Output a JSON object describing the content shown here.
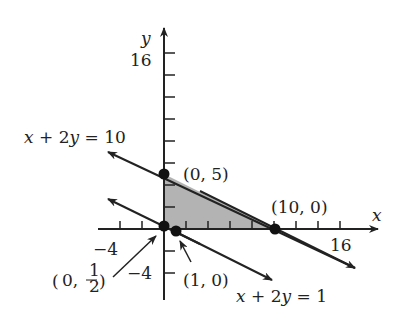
{
  "diagram": {
    "type": "linear-inequality-graph",
    "axes": {
      "x_label": "x",
      "y_label": "y",
      "x_tick_labels": [
        "−4",
        "16"
      ],
      "y_tick_labels": [
        "16",
        "−4"
      ],
      "tick_step": 2
    },
    "lines": [
      {
        "equation": "x + 2y = 10",
        "label_lhs": "x",
        "label_mid": " + 2",
        "label_var": "y",
        "label_rhs": " = 10"
      },
      {
        "equation": "x + 2y = 1",
        "label_lhs": "x",
        "label_mid": " + 2",
        "label_var": "y",
        "label_rhs": " = 1"
      }
    ],
    "points": [
      {
        "label": "(0, 5)",
        "x": 0,
        "y": 5
      },
      {
        "label": "(10, 0)",
        "x": 10,
        "y": 0
      },
      {
        "label": "(1, 0)",
        "x": 1,
        "y": 0
      },
      {
        "label_prefix": "(0, ",
        "label_num": "1",
        "label_den": "2",
        "label_suffix": ")",
        "x": 0,
        "y": 0.5
      }
    ],
    "shaded_region": {
      "vertices": [
        [
          0,
          0
        ],
        [
          0,
          5
        ],
        [
          10,
          0
        ]
      ],
      "color": "#b3b3b3"
    }
  }
}
